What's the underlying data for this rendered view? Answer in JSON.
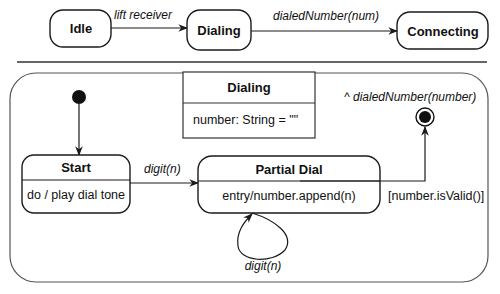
{
  "top_diagram": {
    "states": [
      {
        "id": "idle",
        "label": "Idle"
      },
      {
        "id": "dialing",
        "label": "Dialing"
      },
      {
        "id": "connecting",
        "label": "Connecting"
      }
    ],
    "transitions": [
      {
        "from": "idle",
        "to": "dialing",
        "label": "lift receiver"
      },
      {
        "from": "dialing",
        "to": "connecting",
        "label": "dialedNumber(num)"
      }
    ]
  },
  "composite_state": {
    "class_box": {
      "name": "Dialing",
      "attribute": "number: String = \"\""
    },
    "states": [
      {
        "id": "start",
        "name": "Start",
        "activity": "do / play dial tone"
      },
      {
        "id": "partial_dial",
        "name": "Partial Dial",
        "activity": "entry/number.append(n)"
      }
    ],
    "transitions": [
      {
        "from": "initial",
        "to": "start",
        "label": ""
      },
      {
        "from": "start",
        "to": "partial_dial",
        "label": "digit(n)"
      },
      {
        "from": "partial_dial",
        "to": "partial_dial",
        "label": "digit(n)"
      },
      {
        "from": "partial_dial",
        "to": "final",
        "guard": "[number.isValid()]",
        "action": "^ dialedNumber(number)"
      }
    ]
  },
  "colors": {
    "stroke": "#1a1a1a",
    "frame_stroke": "#555555",
    "background": "#ffffff"
  }
}
